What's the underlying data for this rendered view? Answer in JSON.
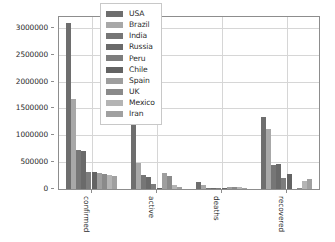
{
  "chart_data": {
    "type": "bar",
    "title": "",
    "xlabel": "",
    "ylabel": "",
    "categories": [
      "confirmed",
      "active",
      "deaths",
      "recovered"
    ],
    "ylim": [
      0,
      3200000
    ],
    "yticks": [
      0,
      500000,
      1000000,
      1500000,
      2000000,
      2500000,
      3000000
    ],
    "ytick_labels": [
      "0",
      "500000",
      "1000000",
      "1500000",
      "2000000",
      "2500000",
      "3000000"
    ],
    "grid": true,
    "legend_position": "upper center",
    "series": [
      {
        "name": "USA",
        "color": "#6e6e6e",
        "values": [
          3097538,
          1592688,
          133972,
          1340000
        ]
      },
      {
        "name": "Brazil",
        "color": "#a8a8a8",
        "values": [
          1668589,
          480000,
          66868,
          1110000
        ]
      },
      {
        "name": "India",
        "color": "#767676",
        "values": [
          719665,
          259557,
          20160,
          439000
        ]
      },
      {
        "name": "Russia",
        "color": "#6a6a6a",
        "values": [
          699749,
          222000,
          10651,
          460000
        ]
      },
      {
        "name": "Peru",
        "color": "#7d7d7d",
        "values": [
          316448,
          85000,
          11314,
          210000
        ]
      },
      {
        "name": "Chile",
        "color": "#636363",
        "values": [
          309274,
          22000,
          6781,
          280000
        ]
      },
      {
        "name": "Spain",
        "color": "#9e9e9e",
        "values": [
          300136,
          290000,
          28401,
          0
        ]
      },
      {
        "name": "UK",
        "color": "#8a8a8a",
        "values": [
          288133,
          243000,
          44650,
          1400
        ]
      },
      {
        "name": "Mexico",
        "color": "#b4b4b4",
        "values": [
          256848,
          75000,
          30639,
          155000
        ]
      },
      {
        "name": "Iran",
        "color": "#a0a0a0",
        "values": [
          245688,
          38000,
          11931,
          195000
        ]
      }
    ]
  },
  "legend": {
    "entries": [
      {
        "label": "USA"
      },
      {
        "label": "Brazil"
      },
      {
        "label": "India"
      },
      {
        "label": "Russia"
      },
      {
        "label": "Peru"
      },
      {
        "label": "Chile"
      },
      {
        "label": "Spain"
      },
      {
        "label": "UK"
      },
      {
        "label": "Mexico"
      },
      {
        "label": "Iran"
      }
    ]
  }
}
